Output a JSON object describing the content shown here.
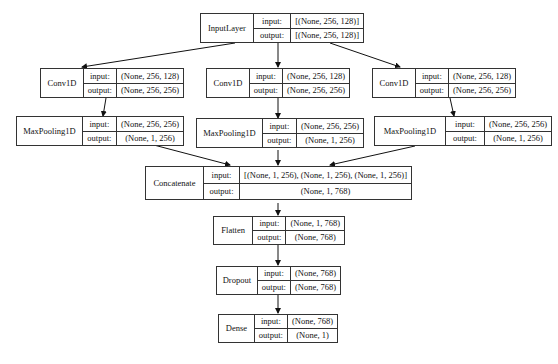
{
  "diagram": {
    "type": "keras-model-plot",
    "io_labels": {
      "input": "input:",
      "output": "output:"
    },
    "nodes": [
      {
        "id": "input_layer",
        "name": "InputLayer",
        "input": "[(None, 256, 128)]",
        "output": "[(None, 256, 128)]"
      },
      {
        "id": "conv1d_1",
        "name": "Conv1D",
        "input": "(None, 256, 128)",
        "output": "(None, 256, 256)"
      },
      {
        "id": "conv1d_2",
        "name": "Conv1D",
        "input": "(None, 256, 128)",
        "output": "(None, 256, 256)"
      },
      {
        "id": "conv1d_3",
        "name": "Conv1D",
        "input": "(None, 256, 128)",
        "output": "(None, 256, 256)"
      },
      {
        "id": "maxpool_1",
        "name": "MaxPooling1D",
        "input": "(None, 256, 256)",
        "output": "(None, 1, 256)"
      },
      {
        "id": "maxpool_2",
        "name": "MaxPooling1D",
        "input": "(None, 256, 256)",
        "output": "(None, 1, 256)"
      },
      {
        "id": "maxpool_3",
        "name": "MaxPooling1D",
        "input": "(None, 256, 256)",
        "output": "(None, 1, 256)"
      },
      {
        "id": "concatenate",
        "name": "Concatenate",
        "input": "[(None, 1, 256), (None, 1, 256), (None, 1, 256)]",
        "output": "(None, 1, 768)"
      },
      {
        "id": "flatten",
        "name": "Flatten",
        "input": "(None, 1, 768)",
        "output": "(None, 768)"
      },
      {
        "id": "dropout",
        "name": "Dropout",
        "input": "(None, 768)",
        "output": "(None, 768)"
      },
      {
        "id": "dense",
        "name": "Dense",
        "input": "(None, 768)",
        "output": "(None, 1)"
      }
    ],
    "edges": [
      [
        "input_layer",
        "conv1d_1"
      ],
      [
        "input_layer",
        "conv1d_2"
      ],
      [
        "input_layer",
        "conv1d_3"
      ],
      [
        "conv1d_1",
        "maxpool_1"
      ],
      [
        "conv1d_2",
        "maxpool_2"
      ],
      [
        "conv1d_3",
        "maxpool_3"
      ],
      [
        "maxpool_1",
        "concatenate"
      ],
      [
        "maxpool_2",
        "concatenate"
      ],
      [
        "maxpool_3",
        "concatenate"
      ],
      [
        "concatenate",
        "flatten"
      ],
      [
        "flatten",
        "dropout"
      ],
      [
        "dropout",
        "dense"
      ]
    ]
  }
}
